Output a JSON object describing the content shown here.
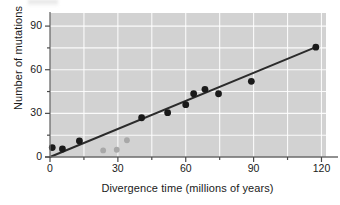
{
  "chart_data": {
    "type": "scatter",
    "title": "",
    "xlabel": "Divergence time (millions of years)",
    "ylabel": "Number of mutations",
    "xlim": [
      0,
      122
    ],
    "ylim": [
      0,
      99
    ],
    "xticks": [
      0,
      30,
      60,
      90,
      120
    ],
    "yticks": [
      0,
      30,
      60,
      90
    ],
    "xtick_labels": [
      "0",
      "30",
      "60",
      "90",
      "120"
    ],
    "ytick_labels": [
      "0",
      "30",
      "60",
      "90"
    ],
    "x_minor_step": 15,
    "y_minor_step": 15,
    "grid": true,
    "grid_color": "#ffffff",
    "plot_bg": "#d2d2d2",
    "legend": null,
    "series": [
      {
        "name": "primary-points",
        "color": "#1a1a1a",
        "marker": "circle",
        "points": [
          {
            "x": 1.0,
            "y": 6.5
          },
          {
            "x": 5.5,
            "y": 5.5
          },
          {
            "x": 13.0,
            "y": 11.0
          },
          {
            "x": 40.5,
            "y": 27.0
          },
          {
            "x": 52.0,
            "y": 30.5
          },
          {
            "x": 60.0,
            "y": 36.0
          },
          {
            "x": 63.5,
            "y": 43.5
          },
          {
            "x": 68.5,
            "y": 46.5
          },
          {
            "x": 74.5,
            "y": 43.5
          },
          {
            "x": 89.0,
            "y": 52.0
          },
          {
            "x": 117.5,
            "y": 75.5
          }
        ]
      },
      {
        "name": "secondary-points",
        "color": "#a8a8a8",
        "marker": "circle",
        "points": [
          {
            "x": 23.5,
            "y": 4.5
          },
          {
            "x": 29.5,
            "y": 5.0
          },
          {
            "x": 34.0,
            "y": 11.5
          }
        ]
      }
    ],
    "trendline": {
      "name": "regression-line",
      "color": "#2b2b2b",
      "x_start": 0.0,
      "y_start": 0.0,
      "x_end": 117.5,
      "y_end": 75.5,
      "slope": 0.642
    }
  }
}
